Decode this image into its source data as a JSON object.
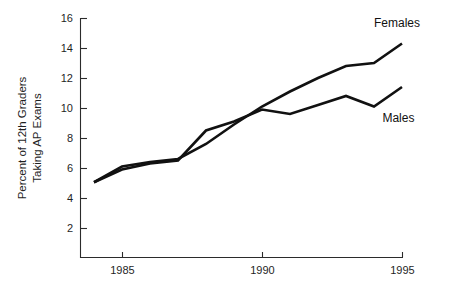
{
  "chart_data": {
    "type": "line",
    "title": "",
    "subtitle": "",
    "xlabel": "",
    "ylabel": "Percent of 12th Graders Taking AP Exams",
    "ylabel_lines": [
      "Percent of 12th Graders",
      "Taking AP Exams"
    ],
    "x": [
      1984,
      1985,
      1986,
      1987,
      1988,
      1989,
      1990,
      1991,
      1992,
      1993,
      1994,
      1995
    ],
    "xlim": [
      1984,
      1995
    ],
    "ylim": [
      0,
      16
    ],
    "xticks": [
      1985,
      1990,
      1995
    ],
    "xtick_labels": [
      "1985",
      "1990",
      "1995"
    ],
    "yticks": [
      2,
      4,
      6,
      8,
      10,
      12,
      14,
      16
    ],
    "ytick_labels": [
      "2",
      "4",
      "6",
      "8",
      "10",
      "12",
      "14",
      "16"
    ],
    "grid": false,
    "legend_position": "inline-right",
    "series": [
      {
        "name": "Females",
        "color": "#111111",
        "label_x": 1994.0,
        "label_y": 15.4,
        "values": [
          5.05,
          6.1,
          6.4,
          6.6,
          7.6,
          8.9,
          10.1,
          11.1,
          12.0,
          12.8,
          13.0,
          14.3
        ]
      },
      {
        "name": "Males",
        "color": "#111111",
        "label_x": 1994.3,
        "label_y": 9.1,
        "values": [
          5.05,
          5.9,
          6.3,
          6.5,
          8.5,
          9.1,
          9.9,
          9.6,
          10.2,
          10.8,
          10.1,
          11.4
        ]
      }
    ],
    "annotations": [
      {
        "text": "Females",
        "x": 1994.0,
        "y": 15.4
      },
      {
        "text": "Males",
        "x": 1994.3,
        "y": 9.1
      }
    ]
  },
  "labels": {
    "series_females": "Females",
    "series_males": "Males",
    "y_axis_line1": "Percent of 12th Graders",
    "y_axis_line2": "Taking AP Exams",
    "ytick_2": "2",
    "ytick_4": "4",
    "ytick_6": "6",
    "ytick_8": "8",
    "ytick_10": "10",
    "ytick_12": "12",
    "ytick_14": "14",
    "ytick_16": "16",
    "xtick_1985": "1985",
    "xtick_1990": "1990",
    "xtick_1995": "1995"
  }
}
